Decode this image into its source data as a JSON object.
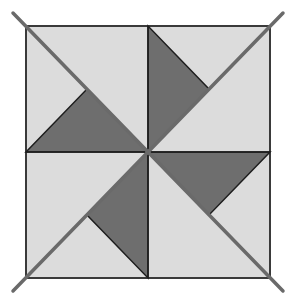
{
  "figure": {
    "colors": {
      "background": "#ffffff",
      "light_fill": "#dcdcdc",
      "dark_fill": "#6e6e6e",
      "border": "#3a3a3a",
      "diagonal": "#6a6a6a",
      "inner_line": "#1e1e1e"
    },
    "square": {
      "x1": 26,
      "y1": 26,
      "x2": 270,
      "y2": 278
    },
    "center": {
      "x": 148,
      "y": 152
    },
    "diagonals": [
      {
        "name": "main-diagonal",
        "x1": 13,
        "y1": 13,
        "x2": 283,
        "y2": 291
      },
      {
        "name": "anti-diagonal",
        "x1": 283,
        "y1": 13,
        "x2": 13,
        "y2": 291
      }
    ],
    "dark_triangles": [
      {
        "name": "top-left",
        "points": "26,152 148,152 87,89"
      },
      {
        "name": "top-right",
        "points": "148,26 148,152 209,89"
      },
      {
        "name": "bottom-right",
        "points": "148,152 270,152 209,215"
      },
      {
        "name": "bottom-left",
        "points": "148,152 148,278 87,215"
      }
    ]
  }
}
